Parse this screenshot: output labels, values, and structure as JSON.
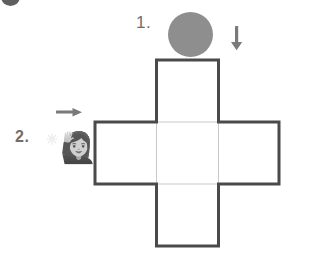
{
  "diagram": {
    "background_color": "#ffffff",
    "steps": [
      {
        "number": "1.",
        "icon": "gray-disc",
        "arrow": "down-arrow"
      },
      {
        "number": "2.",
        "icon": "person-raising-hand-emoji",
        "arrow": "right-arrow"
      }
    ],
    "corner_blob": {
      "name": "clipped-dark-circle",
      "color": "#5f5f5f"
    },
    "step1": {
      "label": "1.",
      "disc": {
        "color": "#8e8e8e",
        "shape": "circle"
      },
      "arrow": {
        "direction": "down",
        "glyph": "↓",
        "color": "#7a7a7a"
      }
    },
    "step2": {
      "label": "2.",
      "arrow": {
        "direction": "right",
        "glyph": "→",
        "color": "#7a7a7a"
      },
      "sparkle": {
        "name": "sparkle",
        "color": "#cccccc"
      },
      "person": {
        "glyph": "🙋‍♀️",
        "description": "person raising hand"
      }
    },
    "net": {
      "name": "cube-net-cross",
      "shape": "plus",
      "cell_size": 61,
      "outer_stroke_color": "#4a4a4a",
      "outer_stroke_width": 3,
      "inner_stroke_color": "#c9c9c9",
      "inner_stroke_width": 1,
      "fill": "#ffffff",
      "cells": [
        {
          "name": "top-face",
          "col": 1,
          "row": 0
        },
        {
          "name": "left-face",
          "col": 0,
          "row": 1
        },
        {
          "name": "center-face",
          "col": 1,
          "row": 1
        },
        {
          "name": "right-face",
          "col": 2,
          "row": 1
        },
        {
          "name": "bottom-face",
          "col": 1,
          "row": 2
        }
      ]
    }
  }
}
